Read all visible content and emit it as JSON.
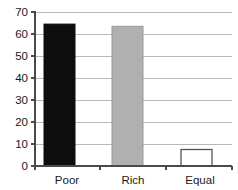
{
  "chart_data": {
    "type": "bar",
    "title": "",
    "subtitle": "",
    "xlabel": "",
    "ylabel": "",
    "categories": [
      "Poor",
      "Rich",
      "Equal"
    ],
    "values": [
      64.5,
      63.5,
      7.5
    ],
    "series": [
      {
        "name": "",
        "values": [
          64.5,
          63.5,
          7.5
        ]
      }
    ],
    "bar_colors": [
      "#0d0d0d",
      "#b0b0b0",
      "#ffffff"
    ],
    "bar_edge_colors": [
      "#0d0d0d",
      "#9a9a9a",
      "#555555"
    ],
    "ylim": [
      0,
      70
    ],
    "xlim": [
      0,
      3
    ],
    "yticks": [
      0,
      10,
      20,
      30,
      40,
      50,
      60,
      70
    ],
    "ytick_labels": [
      "0",
      "10",
      "20",
      "30",
      "40",
      "50",
      "60",
      "70"
    ],
    "xtick_labels": [
      "Poor",
      "Rich",
      "Equal"
    ],
    "grid": true,
    "grid_axis": "y",
    "legend": false,
    "legend_position": "none",
    "annotations": []
  },
  "axis": {
    "y_tick_0": "0",
    "y_tick_10": "10",
    "y_tick_20": "20",
    "y_tick_30": "30",
    "y_tick_40": "40",
    "y_tick_50": "50",
    "y_tick_60": "60",
    "y_tick_70": "70"
  },
  "categories": {
    "cat_0": "Poor",
    "cat_1": "Rich",
    "cat_2": "Equal"
  },
  "colors": {
    "bar_poor": "#0d0d0d",
    "bar_rich": "#b0b0b0",
    "bar_equal": "#ffffff",
    "bar_equal_edge": "#555555",
    "gridline": "#b9b9b9",
    "axis": "#4a4a4a",
    "text": "#1a1a1a",
    "background": "#ffffff"
  }
}
